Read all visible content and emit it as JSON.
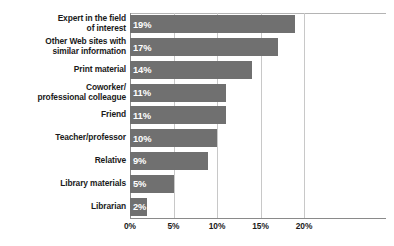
{
  "chart_data": {
    "type": "bar",
    "orientation": "horizontal",
    "title": "",
    "subtitle": "",
    "xlabel": "",
    "ylabel": "",
    "xlim": [
      0,
      23
    ],
    "axis_max_tick": 20,
    "grid": true,
    "legend": null,
    "categories": [
      "Expert in the field\nof interest",
      "Other Web sites with\nsimilar information",
      "Print material",
      "Coworker/\nprofessional colleague",
      "Friend",
      "Teacher/professor",
      "Relative",
      "Library materials",
      "Librarian"
    ],
    "values": [
      19,
      17,
      14,
      11,
      11,
      10,
      9,
      5,
      2
    ],
    "data_labels": [
      "19%",
      "17%",
      "14%",
      "11%",
      "11%",
      "10%",
      "9%",
      "5%",
      "2%"
    ],
    "xticks": [
      0,
      5,
      10,
      15,
      20
    ],
    "xtick_labels": [
      "0%",
      "5%",
      "10%",
      "15%",
      "20%"
    ],
    "bar_color": "#707070",
    "grid_color": "#c8c8c8",
    "axis_color": "#8a8a8a",
    "label_color": "#1a1a1a",
    "value_label_color": "#ffffff",
    "background": "#ffffff",
    "rows": [
      {
        "label_line1": "Expert in the field",
        "label_line2": "of interest",
        "value": 19,
        "data_label": "19%"
      },
      {
        "label_line1": "Other Web sites with",
        "label_line2": "similar information",
        "value": 17,
        "data_label": "17%"
      },
      {
        "label_line1": "Print material",
        "label_line2": "",
        "value": 14,
        "data_label": "14%"
      },
      {
        "label_line1": "Coworker/",
        "label_line2": "professional colleague",
        "value": 11,
        "data_label": "11%"
      },
      {
        "label_line1": "Friend",
        "label_line2": "",
        "value": 11,
        "data_label": "11%"
      },
      {
        "label_line1": "Teacher/professor",
        "label_line2": "",
        "value": 10,
        "data_label": "10%"
      },
      {
        "label_line1": "Relative",
        "label_line2": "",
        "value": 9,
        "data_label": "9%"
      },
      {
        "label_line1": "Library materials",
        "label_line2": "",
        "value": 5,
        "data_label": "5%"
      },
      {
        "label_line1": "Librarian",
        "label_line2": "",
        "value": 2,
        "data_label": "2%"
      }
    ]
  }
}
